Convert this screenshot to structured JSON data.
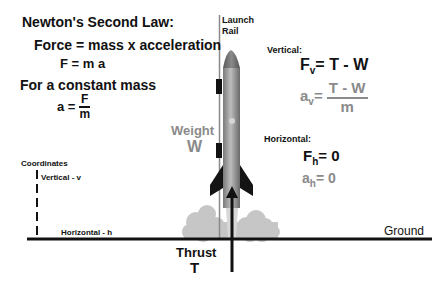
{
  "title": "Newton's Second Law:",
  "equations_left": {
    "force_eq": "Force = mass  x  acceleration",
    "f_eq": "F = m a",
    "constant_mass": "For a constant mass",
    "a_lhs": "a =",
    "a_num": "F",
    "a_den": "m"
  },
  "labels": {
    "launch_rail": "Launch",
    "launch_rail_2": "Rail",
    "weight": "Weight",
    "weight_symbol": "W",
    "thrust": "Thrust",
    "thrust_symbol": "T",
    "ground": "Ground",
    "coordinates": "Coordinates",
    "vertical_axis": "Vertical - v",
    "horizontal_axis": "Horizontal - h"
  },
  "vertical": {
    "heading": "Vertical:",
    "force_lhs": "F",
    "force_sub": "v",
    "force_rhs": "=  T  -  W",
    "accel_lhs": "a",
    "accel_sub": "v",
    "accel_eq": "=",
    "accel_num": "T  -  W",
    "accel_den": "m"
  },
  "horizontal": {
    "heading": "Horizontal:",
    "force_lhs": "F",
    "force_sub": "h",
    "force_rhs": "=  0",
    "accel_lhs": "a",
    "accel_sub": "h",
    "accel_rhs": "=  0"
  },
  "colors": {
    "text": "#111111",
    "gray_text": "#8a8a8a",
    "smoke": "#c4c4c4",
    "rocket_body": "#9a9a9a",
    "rocket_nose": "#6e6e6e",
    "fins": "#141414"
  }
}
